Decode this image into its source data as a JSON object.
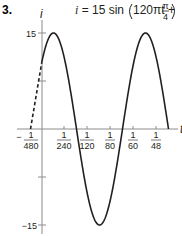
{
  "problem_number": "3.",
  "equation": {
    "lhs": "i",
    "eq": " = 15 sin",
    "arg": "120πt + ",
    "frac_num": "π",
    "frac_den": "4"
  },
  "axes": {
    "x_label": "t",
    "y_label": "i",
    "y_tick_labels": [
      "15",
      "−15"
    ],
    "x_tick_labels": [
      {
        "num": "1",
        "den": "480",
        "sign": "−"
      },
      {
        "num": "1",
        "den": "240",
        "sign": ""
      },
      {
        "num": "1",
        "den": "120",
        "sign": ""
      },
      {
        "num": "1",
        "den": "80",
        "sign": ""
      },
      {
        "num": "1",
        "den": "60",
        "sign": ""
      },
      {
        "num": "1",
        "den": "48",
        "sign": ""
      }
    ]
  },
  "colors": {
    "curve": "#231f20",
    "axis": "#8c8c8c"
  },
  "chart_data": {
    "type": "line",
    "xlabel": "t",
    "ylabel": "i",
    "function": "15*sin(120*pi*t + pi/4)",
    "amplitude": 15,
    "angular_frequency": "120π",
    "phase": "π/4",
    "period": "1/60",
    "x_ticks": [
      "-1/480",
      "1/240",
      "1/120",
      "1/80",
      "1/60",
      "1/48"
    ],
    "x_tick_values": [
      -0.0020833,
      0.0041667,
      0.0083333,
      0.0125,
      0.0166667,
      0.0208333
    ],
    "y_ticks": [
      15,
      7.5,
      0,
      -7.5,
      -15
    ],
    "y_tick_labels": [
      "15",
      "",
      "",
      "",
      "−15"
    ],
    "xlim": [
      -0.0021,
      0.0245
    ],
    "ylim": [
      -15,
      15
    ],
    "dashed_segment": {
      "from": [
        -0.0020833,
        0
      ],
      "to": [
        0,
        10.61
      ]
    },
    "key_points": [
      {
        "t": -0.0020833,
        "i": 0,
        "note": "dashed start"
      },
      {
        "t": 0,
        "i": 10.61
      },
      {
        "t": 0.0020833,
        "i": 15,
        "note": "peak"
      },
      {
        "t": 0.00625,
        "i": 0
      },
      {
        "t": 0.0104167,
        "i": -15,
        "note": "trough"
      },
      {
        "t": 0.0145833,
        "i": 0
      },
      {
        "t": 0.01875,
        "i": 15,
        "note": "peak"
      },
      {
        "t": 0.0229167,
        "i": 0
      }
    ],
    "grid": false,
    "legend": null
  }
}
